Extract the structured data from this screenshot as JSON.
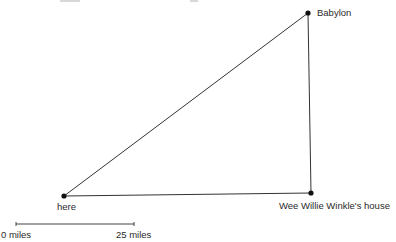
{
  "diagram": {
    "points": [
      {
        "id": "here",
        "label": "here",
        "x": 64,
        "y": 196
      },
      {
        "id": "babylon",
        "label": "Babylon",
        "x": 308,
        "y": 13
      },
      {
        "id": "wee-willie-winkle-house",
        "label": "Wee Willie Winkle's house",
        "x": 311,
        "y": 193
      }
    ],
    "edges": [
      [
        "here",
        "babylon"
      ],
      [
        "babylon",
        "wee-willie-winkle-house"
      ],
      [
        "here",
        "wee-willie-winkle-house"
      ]
    ],
    "line_color": "#333333",
    "dot_color": "#111111"
  },
  "scale_bar": {
    "start_label": "0 miles",
    "end_label": "25 miles",
    "x1": 16,
    "x2": 134,
    "y": 224
  }
}
